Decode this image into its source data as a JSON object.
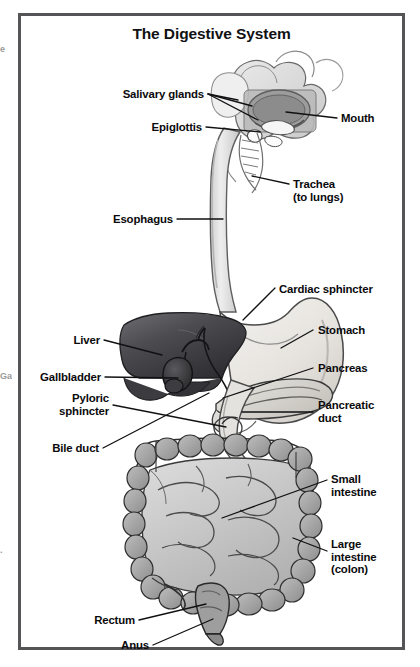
{
  "figure": {
    "title": "The Digestive System",
    "frame_color": "#555558",
    "background_color": "#ffffff",
    "label_color": "#0a0a0c",
    "leader_color": "#111113"
  },
  "edge_fragments": [
    {
      "name": "left-edge-fragment-top",
      "text": "e"
    },
    {
      "name": "left-edge-fragment-mid",
      "text": "Ga"
    },
    {
      "name": "left-edge-fragment-low",
      "text": "."
    }
  ],
  "labels": [
    {
      "id": "salivary-glands",
      "text": "Salivary glands",
      "align": "right"
    },
    {
      "id": "epiglottis",
      "text": "Epiglottis",
      "align": "right"
    },
    {
      "id": "mouth",
      "text": "Mouth",
      "align": "left"
    },
    {
      "id": "trachea",
      "text": "Trachea\n(to lungs)",
      "align": "left"
    },
    {
      "id": "esophagus",
      "text": "Esophagus",
      "align": "right"
    },
    {
      "id": "cardiac-sphincter",
      "text": "Cardiac sphincter",
      "align": "left"
    },
    {
      "id": "liver",
      "text": "Liver",
      "align": "right"
    },
    {
      "id": "stomach",
      "text": "Stomach",
      "align": "left"
    },
    {
      "id": "gallbladder",
      "text": "Gallbladder",
      "align": "right"
    },
    {
      "id": "pancreas",
      "text": "Pancreas",
      "align": "left"
    },
    {
      "id": "pyloric-sphincter",
      "text": "Pyloric\nsphincter",
      "align": "right"
    },
    {
      "id": "pancreatic-duct",
      "text": "Pancreatic\nduct",
      "align": "left"
    },
    {
      "id": "bile-duct",
      "text": "Bile duct",
      "align": "right"
    },
    {
      "id": "small-intestine",
      "text": "Small\nintestine",
      "align": "left"
    },
    {
      "id": "large-intestine",
      "text": "Large\nintestine\n(colon)",
      "align": "left"
    },
    {
      "id": "rectum",
      "text": "Rectum",
      "align": "right"
    },
    {
      "id": "anus",
      "text": "Anus",
      "align": "right"
    }
  ],
  "organs": [
    {
      "id": "head-mouth",
      "name": "mouth-and-head-region",
      "shade": "#d9d9d9"
    },
    {
      "id": "salivary-gland-shape",
      "name": "salivary-gland",
      "shade": "#ededed"
    },
    {
      "id": "tongue",
      "name": "tongue",
      "shade": "#a8a8a8"
    },
    {
      "id": "trachea-shape",
      "name": "trachea",
      "shade": "#e4e4e4"
    },
    {
      "id": "esophagus-shape",
      "name": "esophagus",
      "shade": "#dcdcdc"
    },
    {
      "id": "stomach-shape",
      "name": "stomach",
      "shade": "#e8e6e2"
    },
    {
      "id": "liver-shape",
      "name": "liver",
      "shade": "#4f4f52"
    },
    {
      "id": "gallbladder-shape",
      "name": "gallbladder",
      "shade": "#3a3a3d"
    },
    {
      "id": "pancreas-shape",
      "name": "pancreas",
      "shade": "#d6d4d0"
    },
    {
      "id": "duodenum-shape",
      "name": "duodenum",
      "shade": "#e0dedb"
    },
    {
      "id": "small-intestine-shape",
      "name": "small-intestine",
      "shade": "#c3c3c3"
    },
    {
      "id": "large-intestine-shape",
      "name": "large-intestine-colon",
      "shade": "#a6a6a6"
    },
    {
      "id": "rectum-shape",
      "name": "rectum",
      "shade": "#9e9e9e"
    },
    {
      "id": "anus-shape",
      "name": "anus",
      "shade": "#8f8f8f"
    }
  ]
}
